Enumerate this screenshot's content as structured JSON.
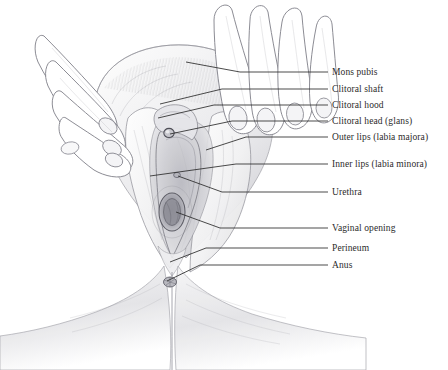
{
  "figure": {
    "name": "vulva-anatomy-pencil-illustration",
    "background_color": "#ffffff",
    "ink_color": "#2b2b2b",
    "pencil_color": "#8d8d93",
    "width": 448,
    "height": 370
  },
  "annotations": [
    {
      "id": "mons-pubis",
      "label": "Mons pubis",
      "label_x": 332,
      "label_y": 67,
      "line": "M 328 72 L 240 72 L 186 62",
      "target_x": 186,
      "target_y": 62
    },
    {
      "id": "clitoral-shaft",
      "label": "Clitoral shaft",
      "label_x": 332,
      "label_y": 84,
      "line": "M 328 89 L 222 89 L 160 104",
      "target_x": 160,
      "target_y": 104
    },
    {
      "id": "clitoral-hood",
      "label": "Clitoral hood",
      "label_x": 332,
      "label_y": 100,
      "line": "M 328 105 L 214 105 L 158 118",
      "target_x": 158,
      "target_y": 118
    },
    {
      "id": "clitoral-head-glans",
      "label": "Clitoral head (glans)",
      "label_x": 332,
      "label_y": 116,
      "line": "M 328 121 L 232 121 L 170 134",
      "target_x": 170,
      "target_y": 134
    },
    {
      "id": "outer-lips-labia-majora",
      "label": "Outer lips (labia majora)",
      "label_x": 332,
      "label_y": 132,
      "line": "M 328 137 L 246 137 L 206 150",
      "target_x": 206,
      "target_y": 150
    },
    {
      "id": "inner-lips-labia-minora",
      "label": "Inner lips (labia minora)",
      "label_x": 332,
      "label_y": 159,
      "line": "M 328 164 L 236 164 L 150 176",
      "target_x": 150,
      "target_y": 176
    },
    {
      "id": "urethra",
      "label": "Urethra",
      "label_x": 332,
      "label_y": 187,
      "line": "M 328 192 L 222 192 L 178 176",
      "target_x": 178,
      "target_y": 176
    },
    {
      "id": "vaginal-opening",
      "label": "Vaginal opening",
      "label_x": 332,
      "label_y": 223,
      "line": "M 328 228 L 220 228 L 176 212",
      "target_x": 176,
      "target_y": 212
    },
    {
      "id": "perineum",
      "label": "Perineum",
      "label_x": 332,
      "label_y": 243,
      "line": "M 328 248 L 206 248 L 170 262",
      "target_x": 170,
      "target_y": 262
    },
    {
      "id": "anus",
      "label": "Anus",
      "label_x": 332,
      "label_y": 260,
      "line": "M 328 265 L 200 265 L 167 281",
      "target_x": 167,
      "target_y": 281
    }
  ]
}
